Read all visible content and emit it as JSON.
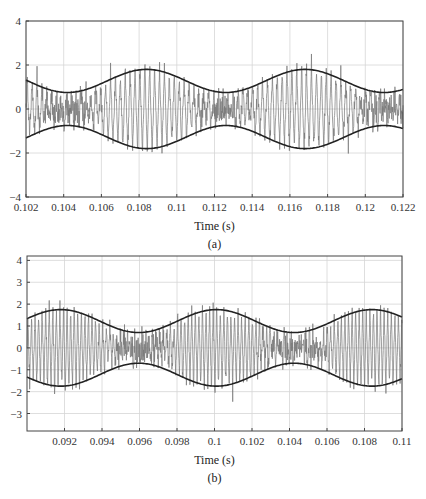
{
  "chart_data": [
    {
      "type": "line",
      "panel_label": "(a)",
      "xlabel": "Time (s)",
      "ylabel": "",
      "xlim": [
        0.102,
        0.122
      ],
      "ylim": [
        -4,
        4
      ],
      "xticks": [
        0.102,
        0.104,
        0.106,
        0.108,
        0.11,
        0.112,
        0.114,
        0.116,
        0.118,
        0.12,
        0.122
      ],
      "xtick_labels": [
        "0.102",
        "0.104",
        "0.106",
        "0.108",
        "0.11",
        "0.112",
        "0.114",
        "0.116",
        "0.118",
        "0.12",
        "0.122"
      ],
      "yticks": [
        -4,
        -2,
        0,
        2,
        4
      ],
      "ytick_labels": [
        "−4",
        "−2",
        "0",
        "2",
        "4"
      ],
      "grid": true,
      "series": [
        {
          "name": "upper envelope",
          "color": "#222222",
          "kind": "envelope",
          "mean": 1.275,
          "amplitude": 0.525,
          "period": 0.0084,
          "peak_t": 0.1084,
          "sign": 1
        },
        {
          "name": "lower envelope",
          "color": "#222222",
          "kind": "envelope",
          "mean": 1.275,
          "amplitude": 0.525,
          "period": 0.0084,
          "peak_t": 0.1084,
          "sign": -1
        },
        {
          "name": "signal",
          "color": "#777777",
          "kind": "signal",
          "carrier_period": 0.00026,
          "seed": 7
        }
      ],
      "envelope_points": {
        "t": [
          0.102,
          0.1042,
          0.1084,
          0.1126,
          0.1168,
          0.121,
          0.122
        ],
        "upper": [
          1.25,
          0.75,
          1.8,
          0.75,
          1.8,
          0.75,
          0.85
        ],
        "lower": [
          -1.25,
          -0.75,
          -1.8,
          -0.75,
          -1.8,
          -0.75,
          -0.85
        ]
      },
      "frame_px": {
        "x0": 26,
        "x1": 403,
        "y0": 21,
        "y1": 197
      }
    },
    {
      "type": "line",
      "panel_label": "(b)",
      "xlabel": "Time (s)",
      "ylabel": "",
      "xlim": [
        0.09,
        0.11
      ],
      "ylim": [
        -3.8,
        4.2
      ],
      "xticks": [
        0.092,
        0.094,
        0.096,
        0.098,
        0.1,
        0.102,
        0.104,
        0.106,
        0.108,
        0.11
      ],
      "xtick_labels": [
        "0.092",
        "0.094",
        "0.096",
        "0.098",
        "0.1",
        "0.102",
        "0.104",
        "0.106",
        "0.108",
        "0.11"
      ],
      "yticks": [
        -3,
        -2,
        -1,
        0,
        1,
        2,
        3,
        4
      ],
      "ytick_labels": [
        "−3",
        "−2",
        "−1",
        "0",
        "1",
        "2",
        "3",
        "4"
      ],
      "grid": true,
      "series": [
        {
          "name": "upper envelope",
          "color": "#222222",
          "kind": "envelope",
          "mean": 1.225,
          "amplitude": 0.525,
          "period": 0.0083,
          "peak_t": 0.1001,
          "sign": 1
        },
        {
          "name": "lower envelope",
          "color": "#222222",
          "kind": "envelope",
          "mean": 1.225,
          "amplitude": 0.525,
          "period": 0.0083,
          "peak_t": 0.1001,
          "sign": -1
        },
        {
          "name": "signal",
          "color": "#777777",
          "kind": "signal",
          "carrier_period": 0.00019,
          "seed": 13
        }
      ],
      "envelope_points": {
        "t": [
          0.09,
          0.0918,
          0.096,
          0.1001,
          0.1042,
          0.1084,
          0.11
        ],
        "upper": [
          1.45,
          1.75,
          0.7,
          1.75,
          0.7,
          1.75,
          1.45
        ],
        "lower": [
          -1.45,
          -1.75,
          -0.7,
          -1.75,
          -0.7,
          -1.75,
          -1.45
        ]
      },
      "frame_px": {
        "x0": 27,
        "x1": 402,
        "y0": 256,
        "y1": 431
      }
    }
  ]
}
